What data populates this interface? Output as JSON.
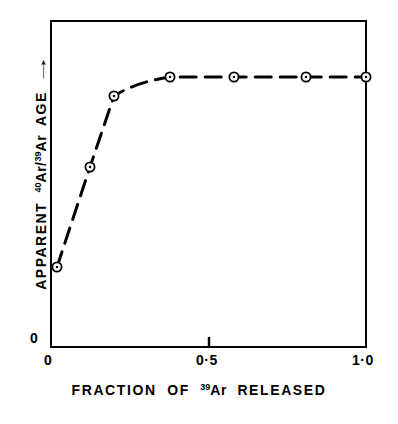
{
  "figure": {
    "background_color": "#ffffff",
    "ink_color": "#000000"
  },
  "axes": {
    "x": {
      "title_prefix": "FRACTION",
      "title_of": "OF",
      "title_superscript": "39",
      "title_element": "Ar",
      "title_suffix": "RELEASED",
      "tick_labels": [
        "0",
        "0·5",
        "1·0"
      ],
      "tick_values": [
        0,
        0.5,
        1.0
      ],
      "range": [
        0,
        1.0
      ]
    },
    "y": {
      "title_prefix": "APPARENT",
      "title_sup1": "40",
      "title_elem1": "Ar",
      "title_slash": "/",
      "title_sup2": "39",
      "title_elem2": "Ar",
      "title_suffix": "AGE",
      "arrow": "→",
      "origin_label": "0"
    }
  },
  "chart_data": {
    "type": "scatter",
    "title": "",
    "subtitle": "",
    "xlabel": "FRACTION OF 39Ar RELEASED",
    "ylabel": "APPARENT 40Ar/39Ar AGE →",
    "xlim": [
      0,
      1.0
    ],
    "ylim": [
      0,
      1.0
    ],
    "grid": false,
    "legend": false,
    "legend_position": "none",
    "x_ticks": [
      0,
      0.5,
      1.0
    ],
    "x_tick_labels": [
      "0",
      "0·5",
      "1·0"
    ],
    "y_ticks": [
      0
    ],
    "y_tick_labels": [
      "0"
    ],
    "marker_style": "open-circle-with-center-dot",
    "line_style": "dashed",
    "annotation": "Plateau reached after ~20% of 39Ar released",
    "series": [
      {
        "name": "Apparent age spectrum",
        "x": [
          0.02,
          0.13,
          0.2,
          0.38,
          0.58,
          0.81,
          1.0
        ],
        "y": [
          0.247,
          0.552,
          0.768,
          0.826,
          0.826,
          0.826,
          0.826
        ],
        "px": [
          57,
          90,
          114,
          170,
          234,
          306,
          366
        ],
        "py": [
          267,
          167,
          96,
          77,
          77,
          77,
          77
        ]
      }
    ]
  }
}
